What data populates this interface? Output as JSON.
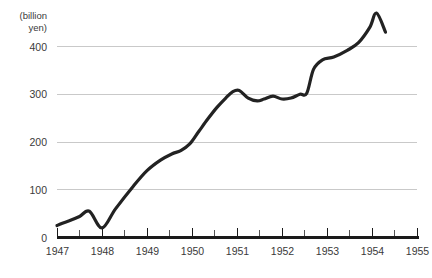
{
  "chart_data": {
    "type": "line",
    "title": "",
    "subtitle": "",
    "xlabel": "",
    "ylabel": "(billion yen)",
    "ylabel_line1": "(billion",
    "ylabel_line2": "yen)",
    "xlim": [
      1947,
      1955
    ],
    "ylim": [
      0,
      480
    ],
    "yticks": [
      0,
      100,
      200,
      300,
      400
    ],
    "ytick_labels": [
      "0",
      "100",
      "200",
      "300",
      "400"
    ],
    "xticks": [
      1947,
      1948,
      1949,
      1950,
      1951,
      1952,
      1953,
      1954,
      1955
    ],
    "xtick_labels": [
      "1947",
      "1948",
      "1949",
      "1950",
      "1951",
      "1952",
      "1953",
      "1954",
      "1955"
    ],
    "minor_xticks": [
      1947.5,
      1948.5,
      1949.5,
      1950.5,
      1951.5,
      1952.5,
      1953.5,
      1954.5
    ],
    "grid": "horizontal",
    "gridlines_at": [
      100,
      200,
      300,
      400
    ],
    "legend": "none",
    "series": [
      {
        "name": "value",
        "color": "#222222",
        "x": [
          1947.0,
          1947.12,
          1947.3,
          1947.5,
          1947.72,
          1948.0,
          1948.3,
          1948.7,
          1949.0,
          1949.3,
          1949.55,
          1949.75,
          1949.95,
          1950.15,
          1950.35,
          1950.55,
          1950.75,
          1950.9,
          1951.05,
          1951.25,
          1951.45,
          1951.6,
          1951.8,
          1952.0,
          1952.2,
          1952.4,
          1952.55,
          1952.7,
          1952.9,
          1953.15,
          1953.45,
          1953.7,
          1953.95,
          1954.1,
          1954.3
        ],
        "y": [
          25,
          30,
          36,
          44,
          55,
          20,
          60,
          108,
          140,
          162,
          175,
          182,
          196,
          222,
          248,
          272,
          292,
          305,
          308,
          292,
          286,
          290,
          296,
          290,
          292,
          300,
          302,
          352,
          372,
          378,
          392,
          408,
          440,
          470,
          430
        ]
      }
    ],
    "annotations": []
  },
  "axis": {
    "y_unit_caption": "(billion yen)"
  }
}
